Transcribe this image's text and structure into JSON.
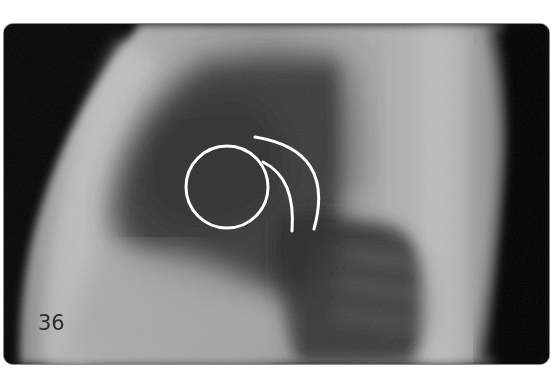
{
  "figure": {
    "label": "36",
    "side_marker": "L",
    "modality": "lateral chest radiograph"
  },
  "annotations": {
    "circle": {
      "cx": 227,
      "cy": 187,
      "r": 41,
      "color": "#ffffff"
    },
    "inner_arc": {
      "color": "#ffffff"
    },
    "outer_arc": {
      "color": "#ffffff"
    }
  },
  "colors": {
    "background": "#ffffff",
    "frame_border": "#8a8a8a",
    "annotation": "#ffffff",
    "marker": "#9a9a9a",
    "label": "#2b2b2b"
  }
}
